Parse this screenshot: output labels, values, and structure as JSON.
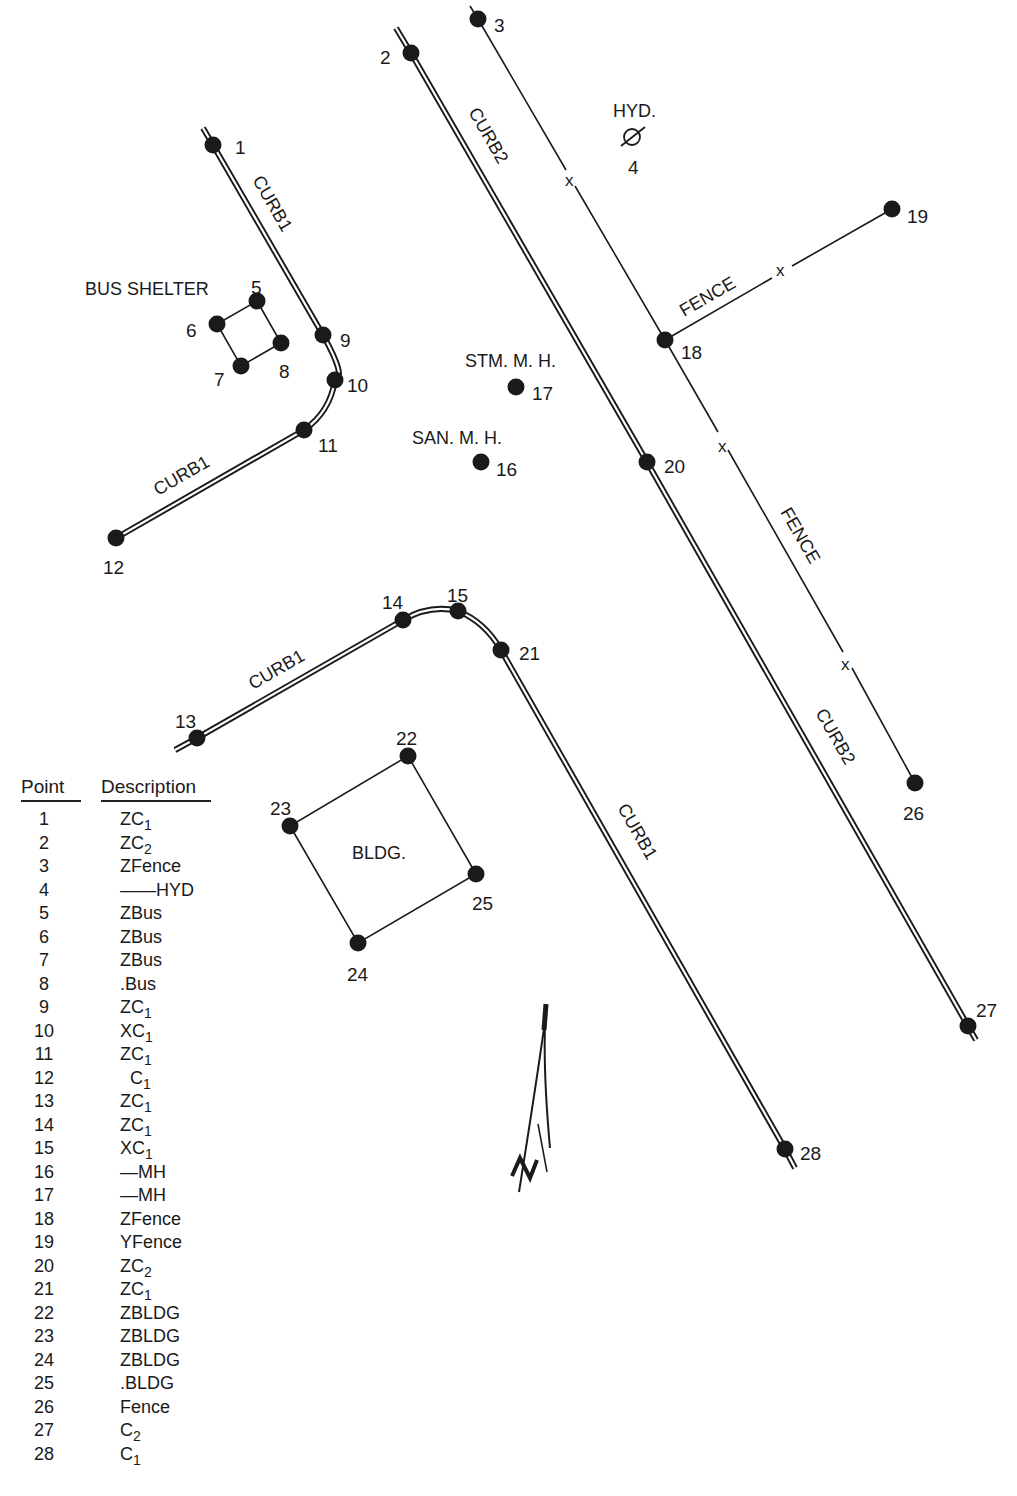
{
  "labels": {
    "curb1": "CURB1",
    "curb2": "CURB2",
    "fence": "FENCE",
    "hyd": "HYD.",
    "bus_shelter": "BUS SHELTER",
    "stm_mh": "STM. M. H.",
    "san_mh": "SAN. M. H.",
    "bldg": "BLDG.",
    "north": "N"
  },
  "legend": {
    "header_point": "Point",
    "header_description": "Description",
    "rows": [
      {
        "point": "1",
        "code": "ZC",
        "sub": "1"
      },
      {
        "point": "2",
        "code": "ZC",
        "sub": "2"
      },
      {
        "point": "3",
        "code": "ZFence",
        "sub": ""
      },
      {
        "point": "4",
        "code": "——HYD",
        "sub": ""
      },
      {
        "point": "5",
        "code": "ZBus",
        "sub": ""
      },
      {
        "point": "6",
        "code": "ZBus",
        "sub": ""
      },
      {
        "point": "7",
        "code": "ZBus",
        "sub": ""
      },
      {
        "point": "8",
        "code": ".Bus",
        "sub": ""
      },
      {
        "point": "9",
        "code": "ZC",
        "sub": "1"
      },
      {
        "point": "10",
        "code": "XC",
        "sub": "1"
      },
      {
        "point": "11",
        "code": "ZC",
        "sub": "1"
      },
      {
        "point": "12",
        "code": "  C",
        "sub": "1"
      },
      {
        "point": "13",
        "code": "ZC",
        "sub": "1"
      },
      {
        "point": "14",
        "code": "ZC",
        "sub": "1"
      },
      {
        "point": "15",
        "code": "XC",
        "sub": "1"
      },
      {
        "point": "16",
        "code": "—MH",
        "sub": ""
      },
      {
        "point": "17",
        "code": "—MH",
        "sub": ""
      },
      {
        "point": "18",
        "code": "ZFence",
        "sub": ""
      },
      {
        "point": "19",
        "code": "YFence",
        "sub": ""
      },
      {
        "point": "20",
        "code": "ZC",
        "sub": "2"
      },
      {
        "point": "21",
        "code": "ZC",
        "sub": "1"
      },
      {
        "point": "22",
        "code": "ZBLDG",
        "sub": ""
      },
      {
        "point": "23",
        "code": "ZBLDG",
        "sub": ""
      },
      {
        "point": "24",
        "code": "ZBLDG",
        "sub": ""
      },
      {
        "point": "25",
        "code": ".BLDG",
        "sub": ""
      },
      {
        "point": "26",
        "code": "Fence",
        "sub": ""
      },
      {
        "point": "27",
        "code": "C",
        "sub": "2"
      },
      {
        "point": "28",
        "code": "C",
        "sub": "1"
      }
    ]
  },
  "points": [
    {
      "id": "1",
      "x": 213,
      "y": 145,
      "lx": 235,
      "ly": 148
    },
    {
      "id": "2",
      "x": 411,
      "y": 53,
      "lx": 380,
      "ly": 58
    },
    {
      "id": "3",
      "x": 478,
      "y": 19,
      "lx": 494,
      "ly": 26
    },
    {
      "id": "4",
      "x": 632,
      "y": 137,
      "lx": 628,
      "ly": 168
    },
    {
      "id": "5",
      "x": 257,
      "y": 301,
      "lx": 251,
      "ly": 288
    },
    {
      "id": "6",
      "x": 217,
      "y": 324,
      "lx": 186,
      "ly": 331
    },
    {
      "id": "7",
      "x": 241,
      "y": 366,
      "lx": 214,
      "ly": 380
    },
    {
      "id": "8",
      "x": 281,
      "y": 343,
      "lx": 279,
      "ly": 372
    },
    {
      "id": "9",
      "x": 323,
      "y": 335,
      "lx": 340,
      "ly": 341
    },
    {
      "id": "10",
      "x": 335,
      "y": 380,
      "lx": 347,
      "ly": 386
    },
    {
      "id": "11",
      "x": 304,
      "y": 430,
      "lx": 318,
      "ly": 446
    },
    {
      "id": "12",
      "x": 116,
      "y": 538,
      "lx": 103,
      "ly": 568
    },
    {
      "id": "13",
      "x": 197,
      "y": 738,
      "lx": 175,
      "ly": 722
    },
    {
      "id": "14",
      "x": 403,
      "y": 620,
      "lx": 382,
      "ly": 603
    },
    {
      "id": "15",
      "x": 458,
      "y": 611,
      "lx": 447,
      "ly": 596
    },
    {
      "id": "16",
      "x": 481,
      "y": 462,
      "lx": 496,
      "ly": 470
    },
    {
      "id": "17",
      "x": 516,
      "y": 387,
      "lx": 532,
      "ly": 394
    },
    {
      "id": "18",
      "x": 665,
      "y": 340,
      "lx": 681,
      "ly": 353
    },
    {
      "id": "19",
      "x": 892,
      "y": 209,
      "lx": 907,
      "ly": 217
    },
    {
      "id": "20",
      "x": 647,
      "y": 462,
      "lx": 664,
      "ly": 467
    },
    {
      "id": "21",
      "x": 501,
      "y": 650,
      "lx": 519,
      "ly": 654
    },
    {
      "id": "22",
      "x": 408,
      "y": 756,
      "lx": 396,
      "ly": 739
    },
    {
      "id": "23",
      "x": 290,
      "y": 826,
      "lx": 270,
      "ly": 809
    },
    {
      "id": "24",
      "x": 358,
      "y": 943,
      "lx": 347,
      "ly": 975
    },
    {
      "id": "25",
      "x": 476,
      "y": 874,
      "lx": 472,
      "ly": 904
    },
    {
      "id": "26",
      "x": 915,
      "y": 783,
      "lx": 903,
      "ly": 814
    },
    {
      "id": "27",
      "x": 968,
      "y": 1026,
      "lx": 976,
      "ly": 1011
    },
    {
      "id": "28",
      "x": 785,
      "y": 1149,
      "lx": 800,
      "ly": 1154
    }
  ],
  "colors": {
    "ink": "#1a1a1a",
    "paper": "#ffffff"
  }
}
